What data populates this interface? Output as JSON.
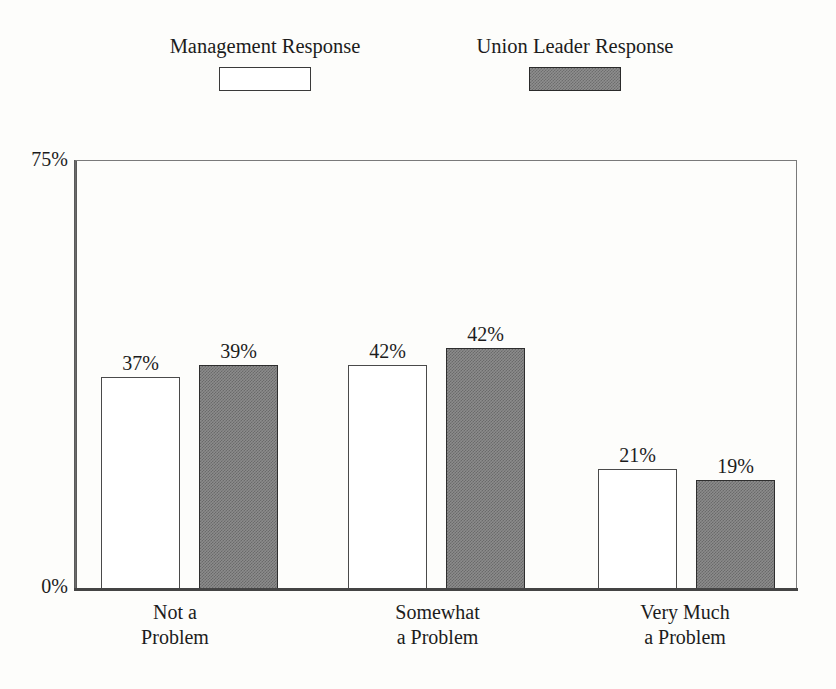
{
  "chart_data": {
    "type": "bar",
    "title": "",
    "subtitle": "",
    "xlabel": "",
    "ylabel": "",
    "ylim": [
      0,
      75
    ],
    "y_tick_labels": [
      "0%",
      "75%"
    ],
    "grid": false,
    "legend_position": "top",
    "value_suffix": "%",
    "categories": [
      "Not a\nProblem",
      "Somewhat\na Problem",
      "Very Much\na Problem"
    ],
    "category_lines": [
      [
        "Not a",
        "Problem"
      ],
      [
        "Somewhat",
        "a Problem"
      ],
      [
        "Very Much",
        "a Problem"
      ]
    ],
    "series": [
      {
        "name": "Management Response",
        "swatch": "open",
        "values": [
          37,
          39,
          21
        ],
        "labels": [
          "37%",
          "42%",
          "21%"
        ]
      },
      {
        "name": "Union Leader Response",
        "swatch": "filled",
        "values": [
          39,
          42,
          19
        ],
        "labels": [
          "39%",
          "42%",
          "19%"
        ]
      }
    ],
    "data_labels": [
      [
        "37%",
        "39%"
      ],
      [
        "42%",
        "42%"
      ],
      [
        "21%",
        "19%"
      ]
    ]
  },
  "legend": {
    "entries": [
      {
        "label": "Management Response",
        "swatch": "open"
      },
      {
        "label": "Union Leader Response",
        "swatch": "filled"
      }
    ]
  },
  "axes": {
    "y_top_label": "75%",
    "y_bottom_label": "0%"
  },
  "colors": {
    "background": "#fdfdfb",
    "frame": "#6b6b6b",
    "text": "#1c1c1c",
    "bar_open_fill": "#ffffff",
    "bar_open_stroke": "#4a4a4a",
    "bar_filled_fill": "#8c8c8c",
    "bar_filled_stroke": "#2e2e2e"
  }
}
